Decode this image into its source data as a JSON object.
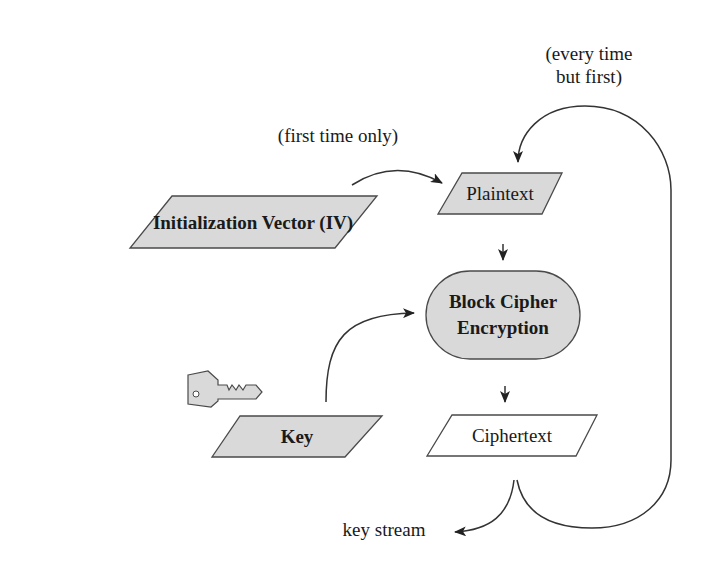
{
  "diagram": {
    "colors": {
      "shape_fill": "#d9d9d9",
      "shape_stroke": "#4a4a4a",
      "line": "#333333",
      "text": "#1a1a1a",
      "background": "#ffffff"
    },
    "nodes": {
      "iv": {
        "label": "Initialization Vector (IV)",
        "shape": "parallelogram",
        "filled": true
      },
      "plaintext": {
        "label": "Plaintext",
        "shape": "parallelogram",
        "filled": true
      },
      "block_cipher": {
        "label_line1": "Block Cipher",
        "label_line2": "Encryption",
        "shape": "stadium",
        "filled": true
      },
      "key": {
        "label": "Key",
        "shape": "parallelogram",
        "filled": true,
        "icon": "key-icon"
      },
      "ciphertext": {
        "label": "Ciphertext",
        "shape": "parallelogram",
        "filled": false
      }
    },
    "annotations": {
      "first_time": "(first time only)",
      "every_time_line1": "(every time",
      "every_time_line2": "but first)",
      "key_stream": "key stream"
    },
    "edges": [
      {
        "from": "iv",
        "to": "plaintext",
        "label": "(first time only)"
      },
      {
        "from": "plaintext",
        "to": "block_cipher"
      },
      {
        "from": "key",
        "to": "block_cipher"
      },
      {
        "from": "block_cipher",
        "to": "ciphertext"
      },
      {
        "from": "ciphertext",
        "to": "key_stream"
      },
      {
        "from": "ciphertext",
        "to": "plaintext",
        "label": "(every time but first)"
      }
    ]
  }
}
